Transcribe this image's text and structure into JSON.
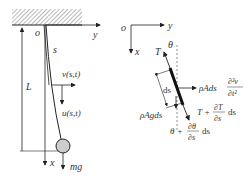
{
  "left_diagram": {
    "origin_label": "o",
    "y_axis_label": "y",
    "x_axis_label": "x",
    "arc_length_label": "s",
    "length_label": "L",
    "v_label": "v(s,t)",
    "u_label": "u(s,t)",
    "weight_label": "mg"
  },
  "right_diagram": {
    "origin_label": "o",
    "y_axis_label": "y",
    "x_axis_label": "x",
    "tension_label": "T",
    "angle_label": "θ",
    "element_label": "ds",
    "inertia_force": {
      "prefix": "ρAds",
      "num": "∂²v",
      "den": "∂t²"
    },
    "gravity_force": "ρAgds",
    "tension_end": {
      "prefix": "T +",
      "num": "∂T",
      "den": "∂s",
      "suffix": "ds"
    },
    "angle_end": {
      "prefix": "θ +",
      "num": "∂θ",
      "den": "∂s",
      "suffix": "ds"
    }
  },
  "colors": {
    "line": "#222222",
    "hatch": "#888888",
    "mass": "#cccccc"
  }
}
